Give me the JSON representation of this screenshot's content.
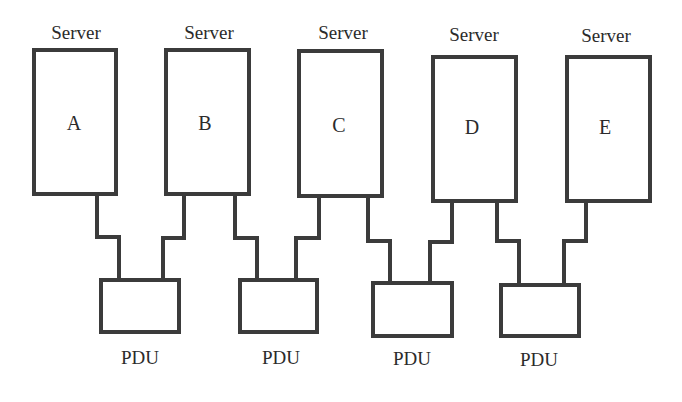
{
  "diagram": {
    "stroke_color": "#3b3b3b",
    "text_color": "#2b2b2b",
    "servers": [
      {
        "id": "A",
        "title": "Server",
        "label": "A",
        "x": 33,
        "y": 49,
        "w": 84,
        "h": 146
      },
      {
        "id": "B",
        "title": "Server",
        "label": "B",
        "x": 165,
        "y": 49,
        "w": 85,
        "h": 146
      },
      {
        "id": "C",
        "title": "Server",
        "label": "C",
        "x": 298,
        "y": 50,
        "w": 85,
        "h": 147
      },
      {
        "id": "D",
        "title": "Server",
        "label": "D",
        "x": 432,
        "y": 56,
        "w": 85,
        "h": 146
      },
      {
        "id": "E",
        "title": "Server",
        "label": "E",
        "x": 566,
        "y": 56,
        "w": 85,
        "h": 146
      }
    ],
    "pdus": [
      {
        "label": "PDU",
        "x": 100,
        "y": 279,
        "w": 80,
        "h": 54
      },
      {
        "label": "PDU",
        "x": 239,
        "y": 279,
        "w": 79,
        "h": 54
      },
      {
        "label": "PDU",
        "x": 372,
        "y": 282,
        "w": 81,
        "h": 55
      },
      {
        "label": "PDU",
        "x": 500,
        "y": 284,
        "w": 80,
        "h": 53
      }
    ],
    "connections": [
      {
        "from": "A",
        "to_pdu": 1
      },
      {
        "from": "B",
        "to_pdu": 1
      },
      {
        "from": "B",
        "to_pdu": 2
      },
      {
        "from": "C",
        "to_pdu": 2
      },
      {
        "from": "C",
        "to_pdu": 3
      },
      {
        "from": "D",
        "to_pdu": 3
      },
      {
        "from": "D",
        "to_pdu": 4
      },
      {
        "from": "E",
        "to_pdu": 4
      }
    ]
  }
}
